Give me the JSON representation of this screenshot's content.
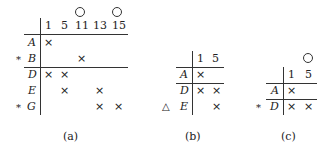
{
  "tables": [
    {
      "caption": "(a)",
      "columns": [
        "1",
        "5",
        "11",
        "13",
        "15"
      ],
      "circled_columns": [
        "11",
        "15"
      ],
      "rows": [
        {
          "label": "A",
          "marker": "",
          "cells": [
            "×",
            "",
            "",
            "",
            ""
          ]
        },
        {
          "label": "B",
          "marker": "*",
          "cells": [
            "",
            "",
            "×",
            "",
            ""
          ]
        },
        {
          "label": "D",
          "marker": "",
          "cells": [
            "×",
            "×",
            "",
            "",
            ""
          ]
        },
        {
          "label": "E",
          "marker": "",
          "cells": [
            "",
            "×",
            "",
            "×",
            ""
          ]
        },
        {
          "label": "G",
          "marker": "*",
          "cells": [
            "",
            "",
            "",
            "×",
            "×"
          ]
        }
      ]
    },
    {
      "caption": "(b)",
      "columns": [
        "1",
        "5"
      ],
      "circled_columns": [],
      "rows": [
        {
          "label": "A",
          "marker": "",
          "cells": [
            "×",
            ""
          ]
        },
        {
          "label": "D",
          "marker": "",
          "cells": [
            "×",
            "×"
          ]
        },
        {
          "label": "E",
          "marker": "△",
          "cells": [
            "",
            "×"
          ]
        }
      ]
    },
    {
      "caption": "(c)",
      "columns": [
        "1",
        "5"
      ],
      "circled_columns": [
        "5"
      ],
      "rows": [
        {
          "label": "A",
          "marker": "",
          "cells": [
            "×",
            ""
          ]
        },
        {
          "label": "D",
          "marker": "*",
          "cells": [
            "×",
            "×"
          ]
        }
      ]
    }
  ]
}
